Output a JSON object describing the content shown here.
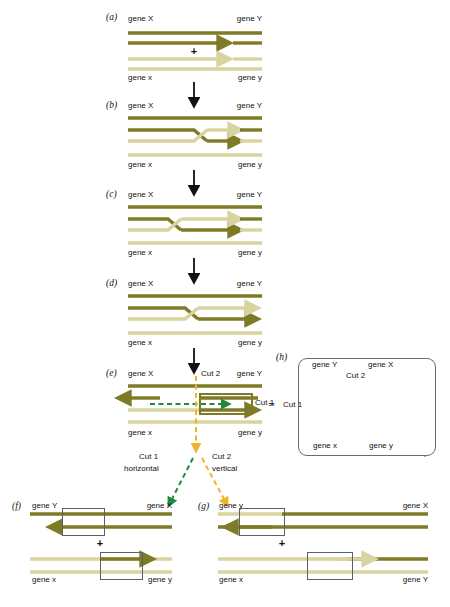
{
  "figure": {
    "colors": {
      "dark_strand": "#7e7a25",
      "light_strand": "#d8d4a0",
      "mid_strand": "#9a9438",
      "cut1_green": "#1f8a3b",
      "cut2_orange": "#f0b429",
      "arrow_black": "#111111",
      "box_outline": "#5b5f66"
    }
  },
  "panels": {
    "a": {
      "label": "(a)",
      "genes": {
        "top_left": "gene X",
        "top_right": "gene Y",
        "bottom_left": "gene x",
        "bottom_right": "gene y"
      },
      "plus": "+"
    },
    "b": {
      "label": "(b)",
      "genes": {
        "top_left": "gene X",
        "top_right": "gene Y",
        "bottom_left": "gene x",
        "bottom_right": "gene y"
      }
    },
    "c": {
      "label": "(c)",
      "genes": {
        "top_left": "gene X",
        "top_right": "gene Y",
        "bottom_left": "gene x",
        "bottom_right": "gene y"
      }
    },
    "d": {
      "label": "(d)",
      "genes": {
        "top_left": "gene X",
        "top_right": "gene Y",
        "bottom_left": "gene x",
        "bottom_right": "gene y"
      }
    },
    "e": {
      "label": "(e)",
      "genes": {
        "top_left": "gene X",
        "top_right": "gene Y",
        "bottom_left": "gene x",
        "bottom_right": "gene y"
      },
      "cut1": "Cut 1",
      "cut2": "Cut 2",
      "equals": "="
    },
    "h": {
      "label": "(h)",
      "genes": {
        "top_left": "gene Y",
        "top_right": "gene X",
        "bottom_left": "gene x",
        "bottom_right": "gene y"
      },
      "cut1": "Cut 1",
      "cut2": "Cut 2"
    },
    "f": {
      "label": "(f)",
      "genes": {
        "top_left": "gene Y",
        "top_right": "gene X",
        "bottom_left": "gene x",
        "bottom_right": "gene y"
      },
      "plus": "+"
    },
    "g": {
      "label": "(g)",
      "genes": {
        "top_left": "gene y",
        "top_right": "gene X",
        "bottom_left": "gene x",
        "bottom_right": "gene Y"
      },
      "plus": "+"
    }
  },
  "branch_labels": {
    "cut1_line1": "Cut 1",
    "cut1_line2": "horizontal",
    "cut2_line1": "Cut 2",
    "cut2_line2": "vertical"
  }
}
